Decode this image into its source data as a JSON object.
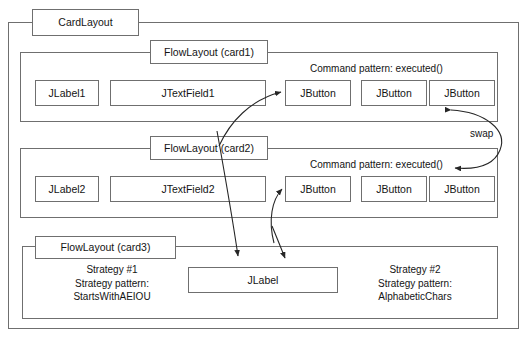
{
  "diagram": {
    "title": "CardLayout",
    "outer_label": "CardLayout",
    "cards": [
      {
        "id": "card1",
        "label": "FlowLayout (card1)",
        "caption": "Command pattern: executed()",
        "widgets": [
          {
            "name": "JLabel1"
          },
          {
            "name": "JTextField1"
          },
          {
            "name": "JButton"
          },
          {
            "name": "JButton"
          },
          {
            "name": "JButton"
          }
        ]
      },
      {
        "id": "card2",
        "label": "FlowLayout (card2)",
        "caption": "Command pattern: executed()",
        "widgets": [
          {
            "name": "JLabel2"
          },
          {
            "name": "JTextField2"
          },
          {
            "name": "JButton"
          },
          {
            "name": "JButton"
          },
          {
            "name": "JButton"
          }
        ]
      },
      {
        "id": "card3",
        "label": "FlowLayout (card3)",
        "strategy_left": "Strategy #1\nStrategy pattern:\nStartsWithAEIOU",
        "strategy_left_lines": {
          "l1": "Strategy #1",
          "l2": "Strategy pattern:",
          "l3": "StartsWithAEIOU"
        },
        "strategy_right_lines": {
          "l1": "Strategy #2",
          "l2": "Strategy pattern:",
          "l3": "AlphabeticChars"
        },
        "widgets": [
          {
            "name": "JLabel"
          }
        ]
      }
    ],
    "swap_label": "swap",
    "colors": {
      "line": "#6f6f6f",
      "text": "#141414",
      "arrow": "#262626",
      "background": "#ffffff"
    }
  }
}
